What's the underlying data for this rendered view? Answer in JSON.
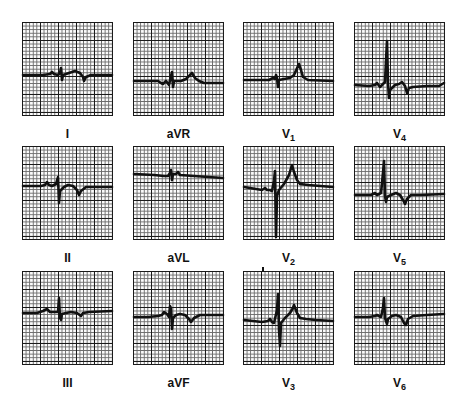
{
  "figure": {
    "leads": [
      {
        "id": "I",
        "label": "I",
        "sub": "",
        "x": 22,
        "y": 22,
        "trace": "0,52 20,52 27,51 29,49 31,51 35,52 37,50 38,45 39,57 40,52 46,50 52,48 57,50 60,54 61,58 63,54 68,52 89,52"
      },
      {
        "id": "aVR",
        "label": "aVR",
        "sub": "",
        "x": 133,
        "y": 22,
        "trace": "0,58 24,58 27,60 29,61 32,58 35,62 37,53 38,49 39,64 40,58 47,58 52,56 56,52 58,50 61,55 65,58 70,60 89,60"
      },
      {
        "id": "V1",
        "label": "V",
        "sub": "1",
        "x": 243,
        "y": 22,
        "trace": "0,57 25,57 29,55 31,56 32,52 33,55 34,64 35,57 40,56 46,55 50,52 54,43 55,41 57,47 59,54 64,57 89,58"
      },
      {
        "id": "V4",
        "label": "V",
        "sub": "4",
        "x": 354,
        "y": 22,
        "trace": "0,62 14,63 20,62 22,60 25,64 30,59 31,38 32,18 33,60 34,75 35,67 40,62 44,61 47,59 50,63 52,70 54,65 58,64 72,63 84,63 89,60"
      },
      {
        "id": "II",
        "label": "II",
        "sub": "",
        "x": 22,
        "y": 146,
        "trace": "0,39 18,39 22,38 24,35 26,38 29,39 33,37 35,30 36,56 37,44 41,40 45,38 50,39 54,43 56,48 58,44 63,40 89,40"
      },
      {
        "id": "aVL",
        "label": "aVL",
        "sub": "",
        "x": 133,
        "y": 146,
        "trace": "0,27 20,28 30,29 34,29 36,26 37,23 38,33 39,27 42,27 44,25 46,28 60,29 89,31"
      },
      {
        "id": "V2",
        "label": "V",
        "sub": "2",
        "x": 243,
        "y": 146,
        "trace": "0,40 18,43 21,41 23,43 26,43 28,44 30,34 31,24 32,90 33,49 35,43 40,37 45,28 48,18 50,25 53,33 56,37 64,38 89,40"
      },
      {
        "id": "V5",
        "label": "V",
        "sub": "5",
        "x": 354,
        "y": 146,
        "trace": "0,48 16,48 20,46 22,48 26,46 28,26 29,14 30,49 31,55 32,50 36,48 41,46 45,48 48,53 50,57 52,52 56,48 66,48 89,47"
      },
      {
        "id": "III",
        "label": "III",
        "sub": "",
        "x": 22,
        "y": 271,
        "trace": "0,41 14,41 20,39 24,37 27,40 30,40 35,40 36,26 37,46 38,48 39,42 43,41 48,40 54,41 58,44 60,41 66,40 89,39"
      },
      {
        "id": "aVF",
        "label": "aVF",
        "sub": "",
        "x": 133,
        "y": 271,
        "trace": "0,45 14,45 24,44 28,43 30,40 33,42 35,45 36,34 37,36 38,57 39,46 42,43 46,42 51,43 55,47 57,50 60,46 66,43 89,43"
      },
      {
        "id": "V3",
        "label": "V",
        "sub": "3",
        "x": 243,
        "y": 271,
        "trace": "0,48 18,50 24,49 26,47 28,50 30,51 33,38 34,22 35,58 36,74 37,51 41,46 46,41 49,36 50,33 53,41 56,46 62,47 72,48 89,49"
      },
      {
        "id": "V6",
        "label": "V",
        "sub": "6",
        "x": 354,
        "y": 271,
        "trace": "0,45 14,45 20,44 22,43 26,45 28,36 29,26 30,46 32,52 33,47 37,44 41,43 46,45 49,51 51,53 53,47 58,44 72,43 89,42"
      }
    ],
    "panel_size": {
      "width": 91,
      "height": 94
    },
    "label_offset_y": 105,
    "colors": {
      "trace": "#111111",
      "major_grid": "#1a1a1a",
      "minor_grid": "#6a6a6a",
      "paper": "#fbfbfb"
    }
  }
}
